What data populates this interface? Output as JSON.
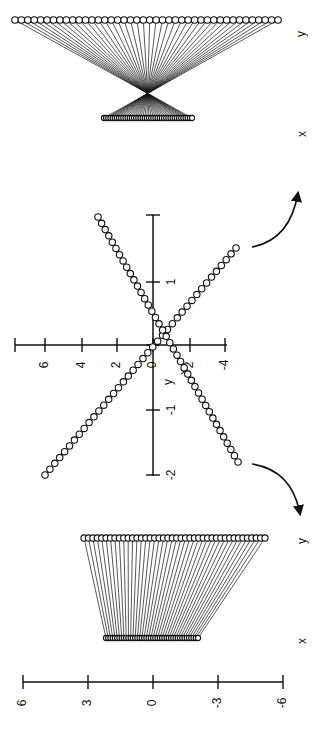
{
  "figure": {
    "orientation": "rotated 90 degrees counter-clockwise",
    "top_panel": {
      "labels": {
        "upper_row": "y",
        "lower_row": "x"
      },
      "upper_row_count": 42,
      "lower_row_count": 42,
      "description": "projection with crossing lines (inverted mapping)"
    },
    "middle_panel": {
      "x_axis_label": "x",
      "y_axis_label": "y",
      "x_ticks": [
        "6",
        "4",
        "2",
        "0",
        "2",
        "-4"
      ],
      "y_ticks": [
        "1",
        "0",
        "-1",
        "-2"
      ],
      "series": [
        {
          "name": "line-rising",
          "points": 24
        },
        {
          "name": "line-falling",
          "points": 30
        }
      ]
    },
    "bottom_panel": {
      "labels": {
        "upper_row": "y",
        "lower_row": "x"
      },
      "upper_row_count": 42,
      "lower_row_count": 42,
      "description": "projection with parallel-ish lines (non-inverted mapping)"
    },
    "scale_bar": {
      "ticks": [
        "6",
        "3",
        "0",
        "-3",
        "-6"
      ]
    },
    "arrows": [
      {
        "name": "arrow-to-top-panel",
        "direction": "up"
      },
      {
        "name": "arrow-to-bottom-panel",
        "direction": "down"
      }
    ]
  },
  "chart_data": {
    "type": "scatter",
    "title": "",
    "xlabel": "x",
    "ylabel": "y",
    "x_ticks": [
      6,
      4,
      2,
      0,
      -2,
      -4
    ],
    "y_ticks": [
      1,
      0,
      -1,
      -2
    ],
    "series": [
      {
        "name": "line A",
        "x_range": [
          6,
          -4.4
        ],
        "y_range": [
          -2,
          1.6
        ]
      },
      {
        "name": "line B",
        "x_range": [
          3.0,
          -4.4
        ],
        "y_range": [
          1.9,
          -1.8
        ]
      }
    ]
  }
}
